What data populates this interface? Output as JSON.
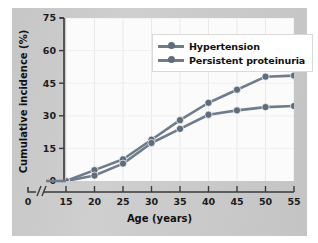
{
  "chart_data": {
    "type": "line",
    "title": "",
    "xlabel": "Age (years)",
    "ylabel": "Cumulative incidence (%)",
    "x": [
      15,
      20,
      25,
      30,
      35,
      40,
      45,
      50,
      55
    ],
    "xlim": [
      15,
      55
    ],
    "ylim": [
      0,
      75
    ],
    "xticks": [
      "0",
      "15",
      "20",
      "25",
      "30",
      "35",
      "40",
      "45",
      "50",
      "55"
    ],
    "yticks": [
      "0",
      "15",
      "30",
      "45",
      "60",
      "75"
    ],
    "ytick_values": [
      0,
      15,
      30,
      45,
      60,
      75
    ],
    "axis_break": true,
    "axis_break_symbol": "//",
    "grid": true,
    "legend_position": "top-right",
    "series": [
      {
        "name": "Hypertension",
        "color": "#6e7c8c",
        "marker": "circle",
        "values": [
          0,
          5,
          10,
          19,
          28,
          36,
          42,
          48,
          48.5
        ]
      },
      {
        "name": "Persistent proteinuria",
        "color": "#6e7c8c",
        "marker": "circle",
        "values": [
          0,
          2.5,
          8,
          17.5,
          24,
          30.5,
          32.5,
          34,
          34.5
        ]
      }
    ]
  },
  "legend": {
    "items": [
      {
        "label": "Hypertension"
      },
      {
        "label": "Persistent proteinuria"
      }
    ]
  },
  "axes": {
    "y_title": "Cumulative incidence (%)",
    "x_title": "Age (years)"
  },
  "colors": {
    "series": "#6e7c8c",
    "marker": "#5f6c7c",
    "panel_background": "#c9c9c9",
    "plot_background": "#fbfbfb",
    "axis": "#3a3a3a"
  }
}
